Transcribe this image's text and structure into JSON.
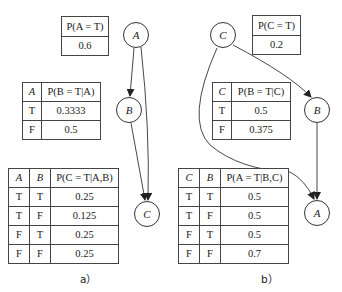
{
  "panel_a": {
    "caption": "a）",
    "nodes": {
      "A": "A",
      "B": "B",
      "C": "C"
    },
    "edges": [
      [
        "A",
        "B"
      ],
      [
        "A",
        "C"
      ],
      [
        "B",
        "C"
      ]
    ],
    "cpt_A": {
      "header": "P(A = T)",
      "value": "0.6"
    },
    "cpt_B": {
      "col_parent": "A",
      "col_prob": "P(B = T|A)",
      "rows": [
        {
          "parent": "T",
          "value": "0.3333"
        },
        {
          "parent": "F",
          "value": "0.5"
        }
      ]
    },
    "cpt_C": {
      "col_p1": "A",
      "col_p2": "B",
      "col_prob": "P(C = T|A,B)",
      "rows": [
        {
          "p1": "T",
          "p2": "T",
          "value": "0.25"
        },
        {
          "p1": "T",
          "p2": "F",
          "value": "0.125"
        },
        {
          "p1": "F",
          "p2": "T",
          "value": "0.25"
        },
        {
          "p1": "F",
          "p2": "F",
          "value": "0.25"
        }
      ]
    }
  },
  "panel_b": {
    "caption": "b）",
    "nodes": {
      "C": "C",
      "B": "B",
      "A": "A"
    },
    "edges": [
      [
        "C",
        "B"
      ],
      [
        "C",
        "A"
      ],
      [
        "B",
        "A"
      ]
    ],
    "cpt_C": {
      "header": "P(C = T)",
      "value": "0.2"
    },
    "cpt_B": {
      "col_parent": "C",
      "col_prob": "P(B = T|C)",
      "rows": [
        {
          "parent": "T",
          "value": "0.5"
        },
        {
          "parent": "F",
          "value": "0.375"
        }
      ]
    },
    "cpt_A": {
      "col_p1": "C",
      "col_p2": "B",
      "col_prob": "P(A = T|B,C)",
      "rows": [
        {
          "p1": "T",
          "p2": "T",
          "value": "0.5"
        },
        {
          "p1": "T",
          "p2": "F",
          "value": "0.5"
        },
        {
          "p1": "F",
          "p2": "T",
          "value": "0.5"
        },
        {
          "p1": "F",
          "p2": "F",
          "value": "0.7"
        }
      ]
    }
  }
}
